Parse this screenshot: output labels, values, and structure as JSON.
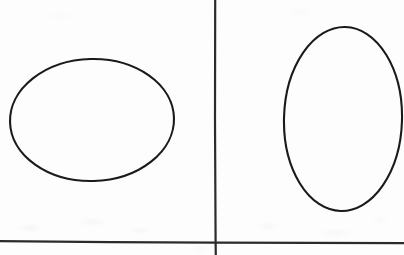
{
  "figure": {
    "medium": "scanned-paper",
    "canvas": {
      "width": 404,
      "height": 255
    },
    "colors": {
      "paper": "#fdfdfd",
      "ink": "#1a1a1a",
      "rule": "#2b2b2b"
    },
    "rules": [
      {
        "name": "vertical-divider",
        "orientation": "vertical",
        "x1": 215,
        "y1": 0,
        "x2": 216,
        "y2": 255,
        "stroke_width": 2.2
      },
      {
        "name": "horizontal-divider",
        "orientation": "horizontal",
        "x1": 0,
        "y1": 241,
        "x2": 404,
        "y2": 243,
        "stroke_width": 2.2
      }
    ],
    "shapes": [
      {
        "name": "left-ellipse",
        "type": "ellipse",
        "orientation": "landscape",
        "cx": 92,
        "cy": 120,
        "rx": 82,
        "ry": 61,
        "rotation": -1.5,
        "stroke_width": 2.1,
        "fill": "none"
      },
      {
        "name": "right-ellipse",
        "type": "ellipse",
        "orientation": "portrait",
        "cx": 343,
        "cy": 119,
        "rx": 59,
        "ry": 92,
        "rotation": 1.5,
        "stroke_width": 2.1,
        "fill": "none",
        "clipped_edge": "right"
      }
    ]
  }
}
